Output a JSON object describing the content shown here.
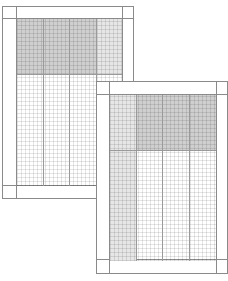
{
  "illustration": {
    "description": "Two overlapping ruled ledger / spreadsheet sheets with shaded header regions",
    "colors": {
      "border": "#8a8a8a",
      "shade_dark": "#cfcfcf",
      "shade_light": "#e6e6e6",
      "background": "#ffffff"
    },
    "sheets": [
      {
        "name": "back-sheet",
        "columns": 4,
        "shaded_region": "top rows, first three columns dark, fourth column light"
      },
      {
        "name": "front-sheet",
        "columns": 4,
        "shaded_region": "top rows, last three columns dark, first column light full-height"
      }
    ]
  }
}
